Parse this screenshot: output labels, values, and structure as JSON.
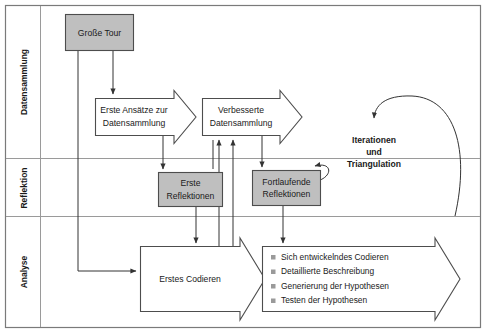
{
  "diagram": {
    "colors": {
      "frame_stroke": "#7a7a7a",
      "lane_divider": "#9a9a9a",
      "shape_stroke": "#4d4d4d",
      "box_fill_gray": "#bfbfbf",
      "shape_fill_white": "#ffffff",
      "connector": "#333333",
      "text": "#1a1a1a",
      "bullet_marker": "#9a9a9a",
      "background": "#ffffff"
    },
    "lanes": [
      {
        "id": "lane-datensammlung",
        "label": "Datensammlung"
      },
      {
        "id": "lane-reflektion",
        "label": "Reflektion"
      },
      {
        "id": "lane-analyse",
        "label": "Analyse"
      }
    ],
    "nodes": {
      "grosse_tour": {
        "label": "Große Tour",
        "shape": "rectangle",
        "fill": "gray"
      },
      "erste_ansaetze": {
        "line1": "Erste Ansätze zur",
        "line2": "Datensammlung",
        "shape": "chevron-arrow",
        "fill": "white"
      },
      "verbesserte": {
        "line1": "Verbesserte",
        "line2": "Datensammlung",
        "shape": "chevron-arrow",
        "fill": "white"
      },
      "erste_reflektionen": {
        "line1": "Erste",
        "line2": "Reflektionen",
        "shape": "rectangle",
        "fill": "gray"
      },
      "fortlaufende_reflektionen": {
        "line1": "Fortlaufende",
        "line2": "Reflektionen",
        "shape": "rectangle",
        "fill": "gray"
      },
      "erstes_codieren": {
        "label": "Erstes Codieren",
        "shape": "block-arrow",
        "fill": "white"
      },
      "analyse_liste": {
        "shape": "block-arrow",
        "fill": "white",
        "items": [
          "Sich entwickelndes Codieren",
          "Detaillierte Beschreibung",
          "Generierung der Hypothesen",
          "Testen der Hypothesen"
        ]
      },
      "iterationen": {
        "line1": "Iterationen",
        "line2": "und",
        "line3": "Triangulation"
      }
    }
  }
}
